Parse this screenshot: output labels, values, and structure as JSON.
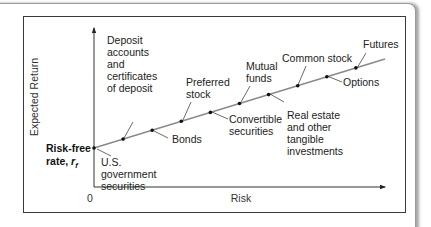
{
  "chart_data": {
    "type": "line",
    "title": "",
    "xlabel": "Risk",
    "ylabel": "Expected Return",
    "origin_label": "0",
    "intercept_label": "Risk-free rate,",
    "intercept_symbol": "r",
    "intercept_subscript": "f",
    "grid": false,
    "points": [
      {
        "name": "U.S. government securities",
        "lines": [
          "U.S.",
          "government",
          "securities"
        ],
        "x": 0,
        "y": 0,
        "label_side": "below"
      },
      {
        "name": "Deposit accounts and certificates of deposit",
        "lines": [
          "Deposit",
          "accounts",
          "and",
          "certificates",
          "of deposit"
        ],
        "x": 1,
        "y": 1,
        "label_side": "above"
      },
      {
        "name": "Bonds",
        "lines": [
          "Bonds"
        ],
        "x": 2,
        "y": 2,
        "label_side": "below"
      },
      {
        "name": "Preferred stock",
        "lines": [
          "Preferred",
          "stock"
        ],
        "x": 3,
        "y": 3,
        "label_side": "above"
      },
      {
        "name": "Convertible securities",
        "lines": [
          "Convertible",
          "securities"
        ],
        "x": 4,
        "y": 4,
        "label_side": "below"
      },
      {
        "name": "Mutual funds",
        "lines": [
          "Mutual",
          "funds"
        ],
        "x": 5,
        "y": 5,
        "label_side": "above"
      },
      {
        "name": "Real estate and other tangible investments",
        "lines": [
          "Real estate",
          "and other",
          "tangible",
          "investments"
        ],
        "x": 6,
        "y": 6,
        "label_side": "below"
      },
      {
        "name": "Common stock",
        "lines": [
          "Common stock"
        ],
        "x": 7,
        "y": 7,
        "label_side": "above"
      },
      {
        "name": "Options",
        "lines": [
          "Options"
        ],
        "x": 8,
        "y": 8,
        "label_side": "below"
      },
      {
        "name": "Futures",
        "lines": [
          "Futures"
        ],
        "x": 9,
        "y": 9,
        "label_side": "above"
      }
    ],
    "line_extends_to_x": 10
  }
}
